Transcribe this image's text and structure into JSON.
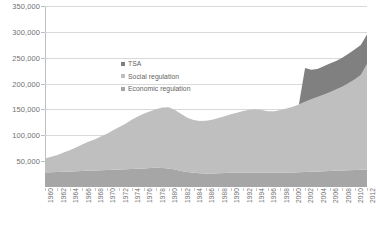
{
  "chart_data": {
    "type": "area",
    "stacked": true,
    "title": "",
    "xlabel": "",
    "ylabel": "",
    "ylim": [
      0,
      350000
    ],
    "ytick_step": 50000,
    "ytick_labels": [
      "350,000",
      "300,000",
      "250,000",
      "200,000",
      "150,000",
      "100,000",
      "50,000"
    ],
    "ytick_values": [
      350000,
      300000,
      250000,
      200000,
      150000,
      100000,
      50000
    ],
    "grid": true,
    "legend_position": "top-left-inside",
    "x": [
      1960,
      1961,
      1962,
      1963,
      1964,
      1965,
      1966,
      1967,
      1968,
      1969,
      1970,
      1971,
      1972,
      1973,
      1974,
      1975,
      1976,
      1977,
      1978,
      1979,
      1980,
      1981,
      1982,
      1983,
      1984,
      1985,
      1986,
      1987,
      1988,
      1989,
      1990,
      1991,
      1992,
      1993,
      1994,
      1995,
      1996,
      1997,
      1998,
      1999,
      2000,
      2001,
      2002,
      2003,
      2004,
      2005,
      2006,
      2007,
      2008,
      2009,
      2010,
      2011,
      2012
    ],
    "xtick_labels": [
      "1960",
      "1962",
      "1964",
      "1966",
      "1968",
      "1970",
      "1972",
      "1974",
      "1976",
      "1978",
      "1980",
      "1982",
      "1984",
      "1986",
      "1988",
      "1990",
      "1992",
      "1994",
      "1996",
      "1998",
      "2000",
      "2002",
      "2004",
      "2006",
      "2008",
      "2010",
      "2012"
    ],
    "xtick_values": [
      1960,
      1962,
      1964,
      1966,
      1968,
      1970,
      1972,
      1974,
      1976,
      1978,
      1980,
      1982,
      1984,
      1986,
      1988,
      1990,
      1992,
      1994,
      1996,
      1998,
      2000,
      2002,
      2004,
      2006,
      2008,
      2010,
      2012
    ],
    "xlabel_rotation": -90,
    "series": [
      {
        "name": "Economic regulation",
        "color": "#a6a6a6",
        "values": [
          28000,
          28500,
          29000,
          29500,
          30000,
          30500,
          31000,
          31500,
          32000,
          32500,
          33000,
          33500,
          34000,
          34500,
          35000,
          35500,
          36000,
          36500,
          37000,
          36500,
          36000,
          34000,
          31000,
          29000,
          27500,
          26500,
          26000,
          26000,
          26500,
          27000,
          27500,
          27800,
          28000,
          28200,
          28200,
          28000,
          27500,
          27500,
          27800,
          28000,
          28200,
          28500,
          29000,
          29500,
          30000,
          30500,
          31000,
          31500,
          32000,
          32500,
          33000,
          33500,
          34000
        ]
      },
      {
        "name": "Social regulation",
        "color": "#bfbfbf",
        "values": [
          27000,
          30000,
          33000,
          37000,
          41000,
          46000,
          51000,
          56000,
          60000,
          65000,
          70000,
          76000,
          82000,
          88000,
          95000,
          101000,
          106000,
          110000,
          114000,
          117000,
          118000,
          115000,
          110000,
          105000,
          102000,
          101000,
          102000,
          104000,
          107000,
          110000,
          113000,
          116000,
          119000,
          121000,
          122000,
          121000,
          119000,
          119000,
          121000,
          124000,
          127000,
          131000,
          136000,
          140000,
          144000,
          148000,
          152000,
          157000,
          162000,
          168000,
          175000,
          183000,
          204000
        ]
      },
      {
        "name": "TSA",
        "color": "#808080",
        "values": [
          0,
          0,
          0,
          0,
          0,
          0,
          0,
          0,
          0,
          0,
          0,
          0,
          0,
          0,
          0,
          0,
          0,
          0,
          0,
          0,
          0,
          0,
          0,
          0,
          0,
          0,
          0,
          0,
          0,
          0,
          0,
          0,
          0,
          0,
          0,
          0,
          0,
          0,
          0,
          0,
          0,
          0,
          65000,
          57000,
          54000,
          55000,
          56000,
          55000,
          56000,
          57000,
          58000,
          58000,
          57000
        ]
      }
    ],
    "legend_order": [
      "TSA",
      "Social regulation",
      "Economic regulation"
    ],
    "totals_note": {
      "start_total": 55000,
      "end_total": 295000,
      "peak_1980_total": 154000,
      "trough_1985_total": 127500
    }
  },
  "colors": {
    "background": "#ffffff",
    "gridline": "#d9d9d9",
    "axis": "#bfbfbf",
    "text": "#707070"
  }
}
